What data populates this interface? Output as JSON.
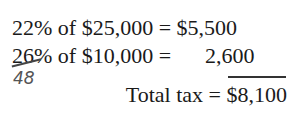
{
  "lines": [
    {
      "text": "22% of $25,000 = $5,500"
    },
    {
      "prefix": "26% of $10,000 = ",
      "value": "2,600"
    },
    {
      "text": "Total tax = $8,100"
    }
  ],
  "annotations": {
    "handwritten_correction": "48",
    "struck_value": "26"
  }
}
